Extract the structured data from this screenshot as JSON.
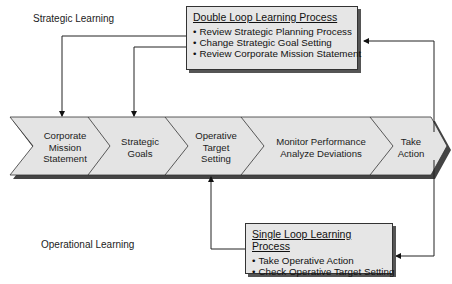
{
  "labels": {
    "strategic_learning": "Strategic Learning",
    "operational_learning": "Operational Learning"
  },
  "double_loop": {
    "title": "Double Loop Learning Process",
    "items": [
      "Review Strategic Planning Process",
      "Change Strategic Goal Setting",
      "Review Corporate Mission Statement"
    ]
  },
  "single_loop": {
    "title": "Single Loop Learning Process",
    "items": [
      "Take Operative Action",
      "Check Operative Target Setting"
    ]
  },
  "process_steps": [
    {
      "line1": "Corporate",
      "line2": "Mission",
      "line3": "Statement"
    },
    {
      "line1": "Strategic",
      "line2": "Goals",
      "line3": ""
    },
    {
      "line1": "Operative",
      "line2": "Target",
      "line3": "Setting"
    },
    {
      "line1": "Monitor Performance",
      "line2": "Analyze Deviations",
      "line3": ""
    },
    {
      "line1": "Take",
      "line2": "Action",
      "line3": ""
    }
  ],
  "colors": {
    "chevron_fill": "#e4e4e4",
    "chevron_stroke": "#333333",
    "shadow": "#555555",
    "line": "#222222"
  }
}
